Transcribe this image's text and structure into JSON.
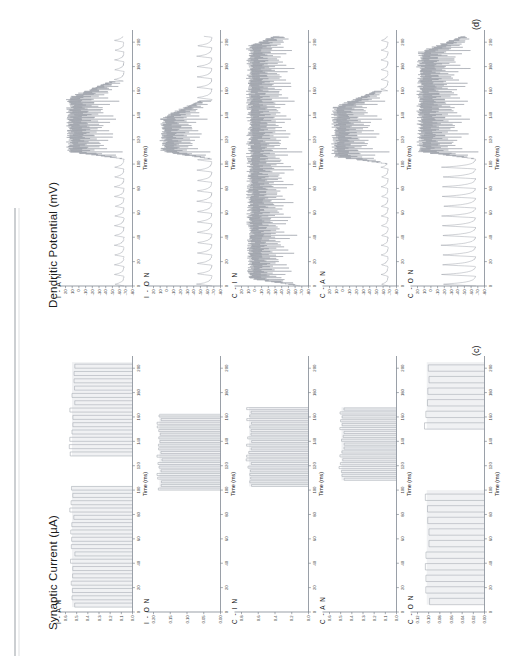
{
  "figure": {
    "columns": [
      {
        "id": "synaptic-current",
        "title": "Synaptic Current (µA)",
        "panel_label": "(c)",
        "x_axis_title": "Time (ms)"
      },
      {
        "id": "dendritic-potential",
        "title": "Dendritic Potential (mV)",
        "panel_label": "(d)",
        "x_axis_title": "Time (ms)"
      }
    ],
    "row_labels": [
      "I - A N",
      "I - O N",
      "C - I N",
      "C - A N",
      "C - O N"
    ]
  },
  "chart_data": [
    {
      "type": "line",
      "id": "c-row1",
      "title": "Synaptic Current — I - A N",
      "xlabel": "Time (ms)",
      "ylabel": "Synaptic Current (µA)",
      "xlim": [
        0,
        210
      ],
      "ylim": [
        0,
        0.6
      ],
      "xticks": [
        0,
        20,
        40,
        60,
        80,
        100,
        120,
        140,
        160,
        180,
        200
      ],
      "yticks": [
        "0.0",
        "0.1",
        "0.2",
        "0.3",
        "0.4",
        "0.5",
        "0.6"
      ],
      "grid": false,
      "legend": "none",
      "burst_windows": [
        [
          4,
          103
        ],
        [
          128,
          205
        ]
      ],
      "pulse_period": 6.0,
      "pulse_amplitude": 0.55,
      "description": "Regular rectangular synaptic-current pulses in two bursts separated by a silent gap."
    },
    {
      "type": "line",
      "id": "c-row2",
      "title": "Synaptic Current — I - O N",
      "xlabel": "Time (ms)",
      "ylabel": "Synaptic Current (µA)",
      "xlim": [
        0,
        210
      ],
      "ylim": [
        0,
        0.2
      ],
      "xticks": [
        0,
        20,
        40,
        60,
        80,
        100,
        120,
        140,
        160,
        180,
        200
      ],
      "yticks": [
        "0.00",
        "0.05",
        "0.10",
        "0.15",
        "0.20"
      ],
      "grid": false,
      "legend": "none",
      "burst_windows": [
        [
          100,
          163
        ]
      ],
      "pulse_period": 3.0,
      "pulse_amplitude": 0.185,
      "description": "Dense high-rate pulse train confined to the 100–163 ms window."
    },
    {
      "type": "line",
      "id": "c-row3",
      "title": "Synaptic Current — C - I N",
      "xlabel": "Time (ms)",
      "ylabel": "Synaptic Current (µA)",
      "xlim": [
        0,
        210
      ],
      "ylim": [
        0,
        0.8
      ],
      "xticks": [
        0,
        20,
        40,
        60,
        80,
        100,
        120,
        140,
        160,
        180,
        200
      ],
      "yticks": [
        "0.0",
        "0.2",
        "0.4",
        "0.6",
        "0.8"
      ],
      "grid": false,
      "legend": "none",
      "burst_windows": [
        [
          103,
          168
        ]
      ],
      "pulse_period": 3.0,
      "pulse_amplitude": 0.72,
      "description": "Dense pulse train in the 103–168 ms window only."
    },
    {
      "type": "line",
      "id": "c-row4",
      "title": "Synaptic Current — C - A N",
      "xlabel": "Time (ms)",
      "ylabel": "Synaptic Current (µA)",
      "xlim": [
        0,
        210
      ],
      "ylim": [
        0,
        0.6
      ],
      "xticks": [
        0,
        20,
        40,
        60,
        80,
        100,
        120,
        140,
        160,
        180,
        200
      ],
      "yticks": [
        "0.0",
        "0.1",
        "0.2",
        "0.3",
        "0.4",
        "0.5",
        "0.6"
      ],
      "grid": false,
      "legend": "none",
      "burst_windows": [
        [
          108,
          168
        ]
      ],
      "pulse_period": 3.2,
      "pulse_amplitude": 0.5,
      "description": "Moderate-amplitude pulse train confined to 108–168 ms."
    },
    {
      "type": "line",
      "id": "c-row5",
      "title": "Synaptic Current — C - O N",
      "xlabel": "Time (ms)",
      "ylabel": "Synaptic Current (µA)",
      "xlim": [
        0,
        210
      ],
      "ylim": [
        0,
        0.12
      ],
      "xticks": [
        0,
        20,
        40,
        60,
        80,
        100,
        120,
        140,
        160,
        180,
        200
      ],
      "yticks": [
        "0.00",
        "0.02",
        "0.04",
        "0.06",
        "0.08",
        "0.10",
        "0.12"
      ],
      "grid": false,
      "legend": "none",
      "burst_windows": [
        [
          6,
          100
        ],
        [
          150,
          205
        ]
      ],
      "pulse_period": 9.5,
      "pulse_amplitude": 0.105,
      "description": "Sparse wide rectangular pulses in two separated bursts."
    },
    {
      "type": "line",
      "id": "d-row1",
      "title": "Dendritic Potential — I - A N",
      "xlabel": "Time (ms)",
      "ylabel": "Dendritic Potential (mV)",
      "xlim": [
        0,
        210
      ],
      "ylim": [
        -80,
        20
      ],
      "xticks": [
        0,
        20,
        40,
        60,
        80,
        100,
        120,
        140,
        160,
        180,
        200
      ],
      "yticks": [
        -80,
        -70,
        -60,
        -50,
        -40,
        -30,
        -20,
        -10,
        0,
        10,
        20
      ],
      "grid": false,
      "legend": "none",
      "baseline_mv": -68,
      "epsp_period": 8.0,
      "epsp_amplitude_mv": 14,
      "burst_window": [
        104,
        168
      ],
      "burst_peak_mv": 12,
      "description": "Small periodic EPSPs from 0–100 ms, a dense high-frequency spike burst 104–168 ms, then decaying spikes to 205 ms."
    },
    {
      "type": "line",
      "id": "d-row2",
      "title": "Dendritic Potential — I - O N",
      "xlabel": "Time (ms)",
      "ylabel": "Dendritic Potential (mV)",
      "xlim": [
        0,
        210
      ],
      "ylim": [
        -80,
        20
      ],
      "xticks": [
        0,
        20,
        40,
        60,
        80,
        100,
        120,
        140,
        160,
        180,
        200
      ],
      "yticks": [
        -80,
        -70,
        -60,
        -50,
        -40,
        -30,
        -20,
        -10,
        0,
        10,
        20
      ],
      "grid": false,
      "legend": "none",
      "baseline_mv": -68,
      "epsp_period": 8.5,
      "epsp_amplitude_mv": 22,
      "burst_window": [
        104,
        152
      ],
      "burst_peak_mv": 4,
      "description": "Large regular EPSPs, a dense burst 104–152 ms, then three tall isolated spikes near 175–200 ms."
    },
    {
      "type": "line",
      "id": "d-row3",
      "title": "Dendritic Potential — C - I N",
      "xlabel": "Time (ms)",
      "ylabel": "Dendritic Potential (mV)",
      "xlim": [
        0,
        210
      ],
      "ylim": [
        -80,
        20
      ],
      "xticks": [
        0,
        20,
        40,
        60,
        80,
        100,
        120,
        140,
        160,
        180,
        200
      ],
      "yticks": [
        -80,
        -70,
        -60,
        -50,
        -40,
        -30,
        -20,
        -10,
        0,
        10,
        20
      ],
      "grid": false,
      "legend": "none",
      "baseline_mv": -68,
      "epsp_period": 8.0,
      "epsp_amplitude_mv": 46,
      "burst_window": [
        0,
        210
      ],
      "burst_peak_mv": 6,
      "description": "Uniform train of large broad spikes across the whole 0–205 ms sweep."
    },
    {
      "type": "line",
      "id": "d-row4",
      "title": "Dendritic Potential — C - A N",
      "xlabel": "Time (ms)",
      "ylabel": "Dendritic Potential (mV)",
      "xlim": [
        0,
        210
      ],
      "ylim": [
        -80,
        20
      ],
      "xticks": [
        0,
        20,
        40,
        60,
        80,
        100,
        120,
        140,
        160,
        180,
        200
      ],
      "yticks": [
        -80,
        -70,
        -60,
        -50,
        -40,
        -30,
        -20,
        -10,
        0,
        10,
        20
      ],
      "grid": false,
      "legend": "none",
      "baseline_mv": -68,
      "epsp_period": 8.0,
      "epsp_amplitude_mv": 10,
      "burst_window": [
        100,
        160
      ],
      "burst_peak_mv": 10,
      "description": "Small EPSPs to 100 ms, a noisy high-amplitude burst 100–160 ms, then two small humps near 175 and 190 ms."
    },
    {
      "type": "line",
      "id": "d-row5",
      "title": "Dendritic Potential — C - O N",
      "xlabel": "Time (ms)",
      "ylabel": "Dendritic Potential (mV)",
      "xlim": [
        0,
        210
      ],
      "ylim": [
        -80,
        20
      ],
      "xticks": [
        0,
        20,
        40,
        60,
        80,
        100,
        120,
        140,
        160,
        180,
        200
      ],
      "yticks": [
        -80,
        -70,
        -60,
        -50,
        -40,
        -30,
        -20,
        -10,
        0,
        10,
        20
      ],
      "grid": false,
      "legend": "none",
      "baseline_mv": -68,
      "epsp_period": 8.0,
      "epsp_amplitude_mv": 50,
      "burst_window": [
        104,
        205
      ],
      "burst_peak_mv": 14,
      "description": "Large broad oscillations 0–100 ms, then a very dense tall spike train 104–205 ms."
    }
  ]
}
